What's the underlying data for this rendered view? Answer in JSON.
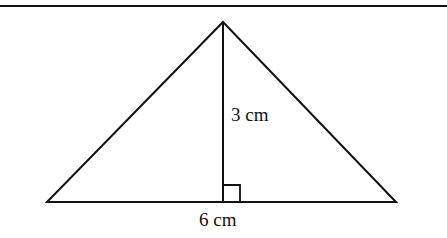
{
  "figure": {
    "type": "triangle",
    "labels": {
      "height": "3 cm",
      "base": "6 cm"
    },
    "measurements": {
      "height_cm": 3,
      "base_cm": 6
    },
    "markers": {
      "right_angle": true
    },
    "colors": {
      "stroke": "#111111",
      "background": "#ffffff"
    }
  }
}
